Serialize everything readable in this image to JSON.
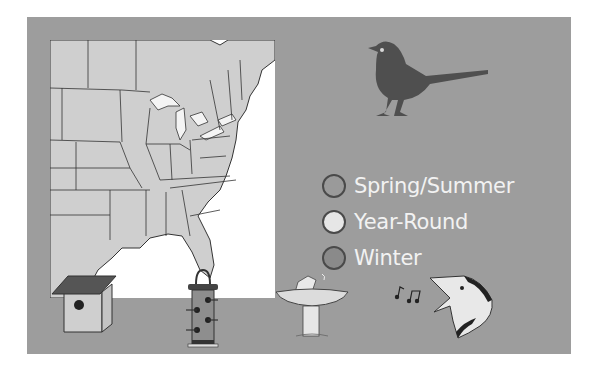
{
  "legend": {
    "items": [
      {
        "label": "Spring/Summer",
        "color": "#9a9a9a"
      },
      {
        "label": "Year-Round",
        "color": "#e6e6e6"
      },
      {
        "label": "Winter",
        "color": "#8a8a8a"
      }
    ]
  },
  "colors": {
    "panel": "#9d9d9d",
    "map_land": "#cfcfcf",
    "map_water": "#ffffff",
    "bird": "#4f4f4f"
  },
  "icons": {
    "species": "bird-silhouette-icon",
    "nesting": "birdhouse-icon",
    "food": "tube-feeder-icon",
    "water": "birdbath-icon",
    "song": "singing-bird-icon"
  }
}
